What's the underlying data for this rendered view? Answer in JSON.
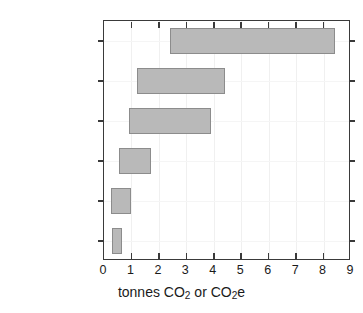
{
  "chart_data": {
    "type": "bar",
    "orientation": "horizontal",
    "subtype": "range-bar",
    "title": "",
    "xlabel": "tonnes CO2 or CO2e",
    "xlabel_parts": [
      {
        "text": "tonnes CO",
        "sub": false
      },
      {
        "text": "2",
        "sub": true
      },
      {
        "text": " or CO",
        "sub": false
      },
      {
        "text": "2",
        "sub": true
      },
      {
        "text": "e",
        "sub": false
      }
    ],
    "ylabel": "",
    "xlim": [
      0,
      9
    ],
    "ylim": [
      0,
      6
    ],
    "grid": true,
    "legend": null,
    "xticks": [
      "0",
      "1",
      "2",
      "3",
      "4",
      "5",
      "6",
      "7",
      "8",
      "9"
    ],
    "categories": [
      "Plane, 1st class CO2/CO2e",
      "Plane, coach CO2/CO2e",
      "Car, 1 rider 50/15 mpg",
      "Amtrak coach/sleeper",
      "Car, 4 riders 50/15 mpg",
      "Bus"
    ],
    "category_labels": [
      {
        "line1": "Plane, 1st class",
        "line2_parts": [
          {
            "text": "CO",
            "sub": false
          },
          {
            "text": "2",
            "sub": true
          },
          {
            "text": "/CO",
            "sub": false
          },
          {
            "text": "2",
            "sub": true
          },
          {
            "text": "e",
            "sub": false
          }
        ]
      },
      {
        "line1": "Plane, coach",
        "line2_parts": [
          {
            "text": "CO",
            "sub": false
          },
          {
            "text": "2",
            "sub": true
          },
          {
            "text": "/CO",
            "sub": false
          },
          {
            "text": "2",
            "sub": true
          },
          {
            "text": "e",
            "sub": false
          }
        ]
      },
      {
        "line1": "Car, 1 rider",
        "line2_parts": [
          {
            "text": "50/15 mpg",
            "sub": false
          }
        ]
      },
      {
        "line1": "Amtrak",
        "line2_parts": [
          {
            "text": "coach/sleeper",
            "sub": false
          }
        ]
      },
      {
        "line1": "Car, 4 riders",
        "line2_parts": [
          {
            "text": "50/15 mpg",
            "sub": false
          }
        ]
      },
      {
        "line1": "Bus",
        "line2_parts": []
      }
    ],
    "ranges": [
      {
        "category": "Plane, 1st class CO2/CO2e",
        "low": 2.4,
        "high": 8.4
      },
      {
        "category": "Plane, coach CO2/CO2e",
        "low": 1.2,
        "high": 4.4
      },
      {
        "category": "Car, 1 rider 50/15 mpg",
        "low": 0.9,
        "high": 3.9
      },
      {
        "category": "Amtrak coach/sleeper",
        "low": 0.55,
        "high": 1.7
      },
      {
        "category": "Car, 4 riders 50/15 mpg",
        "low": 0.25,
        "high": 1.0
      },
      {
        "category": "Bus",
        "low": 0.3,
        "high": 0.65
      }
    ],
    "colors": {
      "bar_fill": "#b9b9b9",
      "bar_edge": "#8c8c8c",
      "axis": "#3a3a3a",
      "text": "#1a1a1a",
      "grid": "#f0f0f0",
      "background": "#ffffff"
    }
  }
}
